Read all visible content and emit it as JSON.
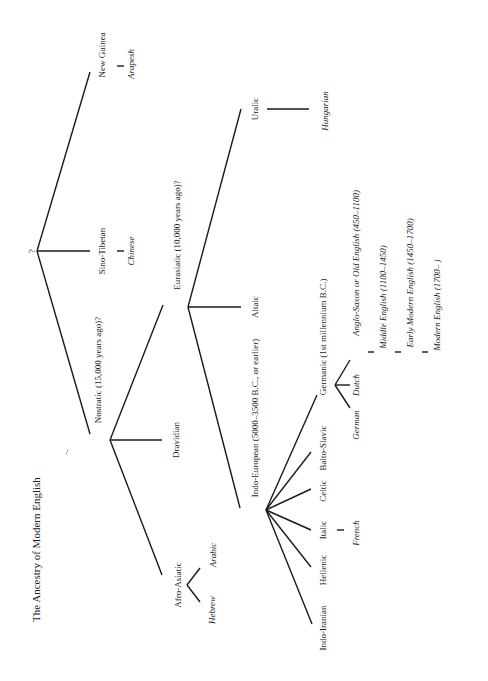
{
  "title": "The Ancestry of Modern English",
  "nodes": {
    "root": "?",
    "nostratic": "Nostratic (15,000 years ago)?",
    "sino_tibetan": "Sino-Tibetan",
    "chinese": "Chinese",
    "new_guinea": "New Guinea",
    "arapesh": "Arapesh",
    "afro_asiatic": "Afro-Asiatic",
    "hebrew": "Hebrew",
    "arabic": "Arabic",
    "dravidian": "Dravidian",
    "eurasiatic": "Eurasiatic (10,000 years ago)?",
    "altaic": "Altaic",
    "uralic": "Uralic",
    "hungarian": "Hungarian",
    "indo_european": "Indo-European (5000–3500 B.C., or earlier)",
    "indo_iranian": "Indo-Iranian",
    "hellenic": "Hellenic",
    "italic": "Italic",
    "french": "French",
    "celtic": "Celtic",
    "balto_slavic": "Balto-Slavic",
    "germanic": "Germanic (1st millennium B.C.)",
    "german": "German",
    "dutch": "Dutch",
    "old_english": "Anglo-Saxon or Old English (450–1100)",
    "middle_english": "Middle English (1100–1450)",
    "early_modern_english": "Early Modern English (1450–1700)",
    "modern_english": "Modern English (1700– )"
  }
}
